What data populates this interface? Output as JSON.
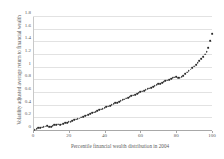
{
  "chart_data": {
    "type": "scatter",
    "title": "",
    "xlabel": "Percentile financial wealth distribution in 2004",
    "ylabel": "Volatility adjusted average return to financial wealth",
    "xlim": [
      0,
      100
    ],
    "ylim": [
      0,
      1.8
    ],
    "xticks": [
      0,
      20,
      40,
      60,
      80,
      100
    ],
    "xtick_labels": [
      "0",
      "20",
      "40",
      "60",
      "80",
      "100"
    ],
    "yticks": [
      0,
      0.2,
      0.4,
      0.6,
      0.8,
      1,
      1.2,
      1.4,
      1.6,
      1.8
    ],
    "ytick_labels": [
      "0",
      "0.2",
      "0.4",
      "0.6",
      "0.8",
      "1",
      "1.2",
      "1.4",
      "1.6",
      "1.8"
    ],
    "grid": "horizontal",
    "legend": "none",
    "marker_color": "#2b2b2b",
    "gridline_color": "#e2e2e2",
    "axis_color": "#a8a8a8",
    "x": [
      1,
      2,
      3,
      4,
      5,
      6,
      7,
      8,
      9,
      10,
      11,
      12,
      13,
      14,
      15,
      16,
      17,
      18,
      19,
      20,
      21,
      22,
      23,
      24,
      25,
      26,
      27,
      28,
      29,
      30,
      31,
      32,
      33,
      34,
      35,
      36,
      37,
      38,
      39,
      40,
      41,
      42,
      43,
      44,
      45,
      46,
      47,
      48,
      49,
      50,
      51,
      52,
      53,
      54,
      55,
      56,
      57,
      58,
      59,
      60,
      61,
      62,
      63,
      64,
      65,
      66,
      67,
      68,
      69,
      70,
      71,
      72,
      73,
      74,
      75,
      76,
      77,
      78,
      79,
      80,
      81,
      82,
      83,
      84,
      85,
      86,
      87,
      88,
      89,
      90,
      91,
      92,
      93,
      94,
      95,
      96,
      97,
      98,
      99,
      100
    ],
    "y": [
      0.02,
      0.03,
      0.05,
      0.055,
      0.06,
      0.07,
      0.075,
      0.085,
      0.07,
      0.065,
      0.08,
      0.095,
      0.1,
      0.105,
      0.095,
      0.105,
      0.115,
      0.125,
      0.13,
      0.14,
      0.15,
      0.16,
      0.175,
      0.185,
      0.19,
      0.2,
      0.215,
      0.225,
      0.235,
      0.245,
      0.26,
      0.27,
      0.285,
      0.295,
      0.305,
      0.315,
      0.33,
      0.34,
      0.355,
      0.365,
      0.38,
      0.39,
      0.4,
      0.415,
      0.425,
      0.44,
      0.45,
      0.465,
      0.475,
      0.49,
      0.5,
      0.515,
      0.525,
      0.54,
      0.555,
      0.565,
      0.575,
      0.59,
      0.6,
      0.615,
      0.625,
      0.635,
      0.65,
      0.665,
      0.675,
      0.685,
      0.7,
      0.715,
      0.73,
      0.74,
      0.75,
      0.765,
      0.775,
      0.79,
      0.8,
      0.81,
      0.825,
      0.835,
      0.845,
      0.855,
      0.84,
      0.835,
      0.85,
      0.875,
      0.9,
      0.925,
      0.95,
      0.975,
      1.0,
      1.02,
      1.05,
      1.08,
      1.11,
      1.14,
      1.17,
      1.21,
      1.25,
      1.31,
      1.42,
      1.53
    ]
  }
}
